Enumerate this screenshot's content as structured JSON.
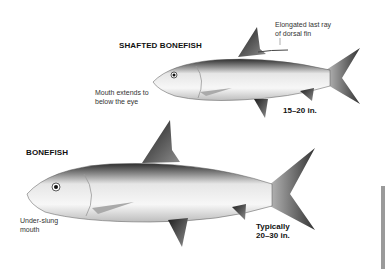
{
  "species": [
    {
      "name": "SHAFTED BONEFISH",
      "size": "15–20 in.",
      "annotations": [
        "Elongated last ray of dorsal fin",
        "Mouth extends to below the eye"
      ]
    },
    {
      "name": "BONEFISH",
      "size_line1": "Typically",
      "size_line2": "20–30 in.",
      "annotations": [
        "Under-slung mouth"
      ]
    }
  ],
  "labels": {
    "shafted_title": "SHAFTED BONEFISH",
    "dorsal_line1": "Elongated last ray",
    "dorsal_line2": "of dorsal fin",
    "mouth_line1": "Mouth extends to",
    "mouth_line2": "below the eye",
    "shafted_size": "15–20 in.",
    "bonefish_title": "BONEFISH",
    "underslung_line1": "Under-slung",
    "underslung_line2": "mouth",
    "bonefish_size_line1": "Typically",
    "bonefish_size_line2": "20–30 in."
  },
  "colors": {
    "background": "#ffffff",
    "text": "#111111",
    "fish_dark": "#3a3a3a",
    "fish_light": "#f2f2f2"
  }
}
